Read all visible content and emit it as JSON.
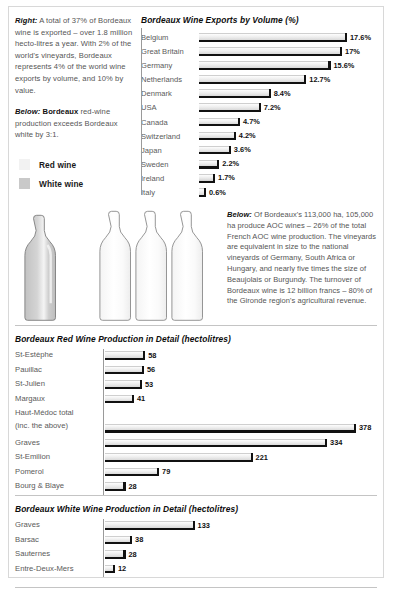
{
  "intro": {
    "right_lead": "Right:",
    "right_text": " A total of 37% of Bordeaux wine is exported – over 1.8 million hecto-litres a year. With 2% of the world's vineyards, Bordeaux represents 4% of the world wine exports by volume, and 10% by value.",
    "below_lead": "Below:",
    "below_bold": " Bordeaux",
    "below_text": " red-wine production exceeds Bordeaux white by 3:1."
  },
  "legend": {
    "items": [
      {
        "label": "Red wine",
        "color": "#f2f2f2"
      },
      {
        "label": "White wine",
        "color": "#c9c9c9"
      }
    ]
  },
  "bottles": {
    "white_count": 1,
    "red_count": 3,
    "ratio": "3:1",
    "white_color": "#c9c9c9",
    "red_color": "#fbfbfb"
  },
  "below_box": {
    "lead": "Below:",
    "text": "  Of Bordeaux's 113,000 ha, 105,000 ha produce AOC wines – 26% of the total French AOC wine production. The vineyards are equivalent in size to the national vineyards of Germany, South Africa or Hungary, and nearly five times the size of Beaujolais or Burgundy. The turnover of Bordeaux wine is 12 billion francs – 80% of the Gironde region's agricultural revenue."
  },
  "chart_data": [
    {
      "type": "bar",
      "orientation": "horizontal",
      "title": "Bordeaux Wine Exports by Volume (%)",
      "xlabel": "",
      "ylabel": "",
      "unit": "%",
      "xlim": [
        0,
        17.6
      ],
      "grid": false,
      "legend": "none",
      "categories": [
        "Belgium",
        "Great Britain",
        "Germany",
        "Netherlands",
        "Denmark",
        "USA",
        "Canada",
        "Switzerland",
        "Japan",
        "Sweden",
        "Ireland",
        "Italy"
      ],
      "values": [
        17.6,
        17,
        15.6,
        12.7,
        8.4,
        7.2,
        4.7,
        4.2,
        3.6,
        2.2,
        1.7,
        0.6
      ],
      "value_labels": [
        "17.6%",
        "17%",
        "15.6%",
        "12.7%",
        "8.4%",
        "7.2%",
        "4.7%",
        "4.2%",
        "3.6%",
        "2.2%",
        "1.7%",
        "0.6%"
      ]
    },
    {
      "type": "bar",
      "orientation": "horizontal",
      "title": "Bordeaux Red Wine Production in Detail (hectolitres)",
      "xlabel": "",
      "ylabel": "",
      "unit": "hectolitres",
      "xlim": [
        0,
        378
      ],
      "grid": false,
      "legend": "none",
      "categories": [
        "St-Estèphe",
        "Pauillac",
        "St-Julien",
        "Margaux",
        "Haut-Médoc total (inc. the above)",
        "Graves",
        "St-Emilion",
        "Pomerol",
        "Bourg & Blaye"
      ],
      "values": [
        58,
        56,
        53,
        41,
        378,
        334,
        221,
        79,
        28
      ],
      "value_labels": [
        "58",
        "56",
        "53",
        "41",
        "378",
        "334",
        "221",
        "79",
        "28"
      ],
      "category_line1": [
        "St-Estèphe",
        "Pauillac",
        "St-Julien",
        "Margaux",
        "Haut-Médoc total",
        "Graves",
        "St-Emilion",
        "Pomerol",
        "Bourg & Blaye"
      ],
      "category_line2": [
        "",
        "",
        "",
        "",
        "(inc. the above)",
        "",
        "",
        "",
        ""
      ]
    },
    {
      "type": "bar",
      "orientation": "horizontal",
      "title": "Bordeaux White Wine Production in Detail (hectolitres)",
      "xlabel": "",
      "ylabel": "",
      "unit": "hectolitres",
      "xlim": [
        0,
        378
      ],
      "grid": false,
      "legend": "none",
      "categories": [
        "Graves",
        "Barsac",
        "Sauternes",
        "Entre-Deux-Mers"
      ],
      "values": [
        133,
        38,
        28,
        12
      ],
      "value_labels": [
        "133",
        "38",
        "28",
        "12"
      ]
    }
  ]
}
